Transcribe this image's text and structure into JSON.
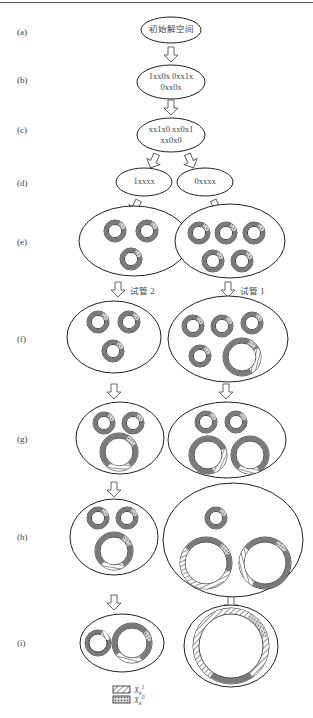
{
  "figure": {
    "row_labels": [
      "(a)",
      "(b)",
      "(c)",
      "(d)",
      "(e)",
      "(f)",
      "(g)",
      "(h)",
      "(i)"
    ],
    "nodes": {
      "a": "初始解空间",
      "b_line1": "1xx0x 0xx1x",
      "b_line2": "0xx0x",
      "c_line1": "xx1x0 xx0x1",
      "c_line2": "xx0x0",
      "d_left": "1xxxx",
      "d_right": "0xxxx"
    },
    "tubes": {
      "left": "试管 2",
      "right": "试管 1"
    },
    "legend": [
      {
        "pattern": "diagonal-hatch",
        "label": "X",
        "sub": "k",
        "sup": "1"
      },
      {
        "pattern": "cross-hatch",
        "label": "X",
        "sub": "k",
        "sup": "0"
      }
    ],
    "colors": {
      "ring_fill": "#7a7a7a",
      "outline": "#222222",
      "arrow": "#555555"
    }
  }
}
